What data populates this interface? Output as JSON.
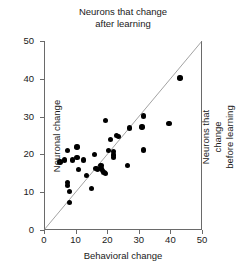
{
  "chart_data": {
    "type": "scatter",
    "title": "Neurons that change\nafter learning",
    "xlabel": "Behavioral change",
    "ylabel": "Neuronal change",
    "right_label": "Neurons that change\nbefore learning",
    "xlim": [
      0,
      50
    ],
    "ylim": [
      0,
      50
    ],
    "xticks": [
      0,
      10,
      20,
      30,
      40,
      50
    ],
    "yticks": [
      0,
      10,
      20,
      30,
      40,
      50
    ],
    "xtick_labels": [
      "0",
      "10",
      "20",
      "30",
      "40",
      "50"
    ],
    "ytick_labels": [
      "0",
      "10",
      "20",
      "30",
      "40",
      "50"
    ],
    "grid": false,
    "legend": false,
    "marker": "filled-circle",
    "marker_color": "#000000",
    "axis_color": "#6a6a6a",
    "reference_line": {
      "name": "identity-line",
      "from": [
        0,
        0
      ],
      "to": [
        50,
        50
      ],
      "color": "#8a8a8a",
      "description": "unity line y = x"
    },
    "points": [
      {
        "x": 5.0,
        "y": 18.0
      },
      {
        "x": 7.5,
        "y": 21.0
      },
      {
        "x": 6.5,
        "y": 18.5
      },
      {
        "x": 7.5,
        "y": 12.5
      },
      {
        "x": 7.5,
        "y": 11.8
      },
      {
        "x": 8.0,
        "y": 10.2
      },
      {
        "x": 8.0,
        "y": 7.2
      },
      {
        "x": 9.0,
        "y": 18.5
      },
      {
        "x": 10.5,
        "y": 22.0
      },
      {
        "x": 10.5,
        "y": 19.2
      },
      {
        "x": 11.0,
        "y": 16.0
      },
      {
        "x": 12.5,
        "y": 18.5
      },
      {
        "x": 13.5,
        "y": 14.5
      },
      {
        "x": 15.0,
        "y": 11.0
      },
      {
        "x": 16.0,
        "y": 20.0
      },
      {
        "x": 16.5,
        "y": 16.2
      },
      {
        "x": 17.0,
        "y": 16.0
      },
      {
        "x": 18.0,
        "y": 17.0
      },
      {
        "x": 18.0,
        "y": 16.2
      },
      {
        "x": 18.5,
        "y": 15.8
      },
      {
        "x": 19.0,
        "y": 15.2
      },
      {
        "x": 19.5,
        "y": 29.0
      },
      {
        "x": 19.5,
        "y": 15.0
      },
      {
        "x": 20.5,
        "y": 21.0
      },
      {
        "x": 21.0,
        "y": 24.0
      },
      {
        "x": 22.0,
        "y": 20.8
      },
      {
        "x": 22.0,
        "y": 19.8
      },
      {
        "x": 22.0,
        "y": 19.2
      },
      {
        "x": 23.0,
        "y": 25.0
      },
      {
        "x": 23.5,
        "y": 24.8
      },
      {
        "x": 26.5,
        "y": 17.0
      },
      {
        "x": 27.0,
        "y": 27.0
      },
      {
        "x": 31.0,
        "y": 27.2
      },
      {
        "x": 31.5,
        "y": 30.2
      },
      {
        "x": 31.5,
        "y": 21.2
      },
      {
        "x": 39.5,
        "y": 28.2
      },
      {
        "x": 43.0,
        "y": 40.2
      }
    ]
  }
}
